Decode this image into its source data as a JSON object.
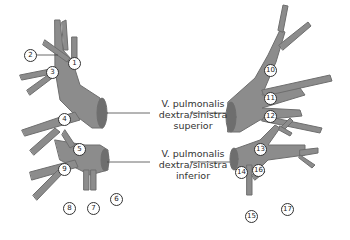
{
  "labels": {
    "superior": [
      "V. pulmonalis",
      "dextra/sinistra",
      "superior"
    ],
    "inferior": [
      "V. pulmonalis",
      "dextra/sinistra",
      "inferior"
    ]
  },
  "numbers": [
    "1",
    "2",
    "3",
    "4",
    "5",
    "6",
    "7",
    "8",
    "9",
    "10",
    "11",
    "12",
    "13",
    "14",
    "15",
    "16",
    "17"
  ],
  "colors": {
    "vessel": "#8c8c8c",
    "vessel_dark": "#6e6e6e",
    "outline": "#555555",
    "text": "#333333"
  }
}
